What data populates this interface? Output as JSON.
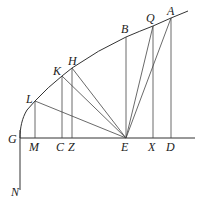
{
  "diagram": {
    "type": "geometric figure",
    "stroke_color": "#333333",
    "background": "#ffffff",
    "points": {
      "G": {
        "label": "G",
        "x": 20,
        "y": 138
      },
      "N": {
        "label": "N",
        "x": 20,
        "y": 190
      },
      "M": {
        "label": "M",
        "x": 35,
        "y": 138
      },
      "C": {
        "label": "C",
        "x": 62,
        "y": 138
      },
      "Z": {
        "label": "Z",
        "x": 72,
        "y": 138
      },
      "E": {
        "label": "E",
        "x": 126,
        "y": 138
      },
      "X": {
        "label": "X",
        "x": 153,
        "y": 138
      },
      "D": {
        "label": "D",
        "x": 171,
        "y": 138
      },
      "L": {
        "label": "L",
        "x": 35,
        "y": 101
      },
      "K": {
        "label": "K",
        "x": 62,
        "y": 76
      },
      "H": {
        "label": "H",
        "x": 72,
        "y": 68
      },
      "B": {
        "label": "B",
        "x": 126,
        "y": 37
      },
      "Q": {
        "label": "Q",
        "x": 153,
        "y": 26
      },
      "A": {
        "label": "A",
        "x": 171,
        "y": 18
      }
    },
    "labels": [
      "A",
      "Q",
      "B",
      "H",
      "K",
      "L",
      "G",
      "M",
      "C",
      "Z",
      "E",
      "X",
      "D",
      "N"
    ],
    "segments": [
      [
        "G",
        "axis-end"
      ],
      [
        "G",
        "N"
      ],
      [
        "L",
        "M"
      ],
      [
        "K",
        "C"
      ],
      [
        "H",
        "Z"
      ],
      [
        "B",
        "E"
      ],
      [
        "Q",
        "X"
      ],
      [
        "A",
        "D"
      ],
      [
        "L",
        "E"
      ],
      [
        "K",
        "E"
      ],
      [
        "H",
        "E"
      ],
      [
        "Q",
        "E"
      ],
      [
        "A",
        "E"
      ]
    ],
    "curve": "parabola from G through L, K, H, B, Q, A"
  }
}
